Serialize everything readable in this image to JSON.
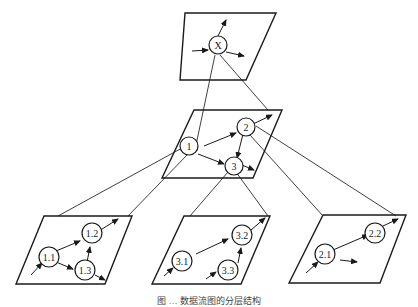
{
  "diagram": {
    "type": "hierarchical-graph-decomposition",
    "top_plane": {
      "nodes": [
        {
          "id": "X",
          "label": "X"
        }
      ]
    },
    "middle_plane": {
      "nodes": [
        {
          "id": "1",
          "label": "1"
        },
        {
          "id": "2",
          "label": "2"
        },
        {
          "id": "3",
          "label": "3"
        }
      ],
      "edges": [
        [
          "1",
          "2"
        ],
        [
          "1",
          "3"
        ],
        [
          "2",
          "3"
        ]
      ]
    },
    "bottom_planes": [
      {
        "parent": "1",
        "nodes": [
          {
            "id": "1.1",
            "label": "1.1"
          },
          {
            "id": "1.2",
            "label": "1.2"
          },
          {
            "id": "1.3",
            "label": "1.3"
          }
        ],
        "edges": [
          [
            "1.1",
            "1.2"
          ],
          [
            "1.1",
            "1.3"
          ],
          [
            "1.3",
            "1.2"
          ]
        ]
      },
      {
        "parent": "3",
        "nodes": [
          {
            "id": "3.1",
            "label": "3.1"
          },
          {
            "id": "3.2",
            "label": "3.2"
          },
          {
            "id": "3.3",
            "label": "3.3"
          }
        ],
        "edges": [
          [
            "3.1",
            "3.2"
          ],
          [
            "3.3",
            "3.2"
          ]
        ]
      },
      {
        "parent": "2",
        "nodes": [
          {
            "id": "2.1",
            "label": "2.1"
          },
          {
            "id": "2.2",
            "label": "2.2"
          }
        ],
        "edges": [
          [
            "2.1",
            "2.2"
          ]
        ]
      }
    ],
    "caption": "图 … 数据流图的分层结构"
  }
}
